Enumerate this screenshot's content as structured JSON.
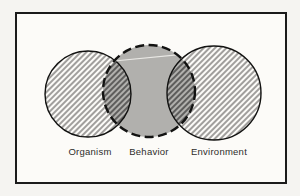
{
  "diagram": {
    "kind": "venn-diagram",
    "labels": {
      "organism": "Organism",
      "behavior": "Behavior",
      "environment": "Environment"
    },
    "colors": {
      "page_background": "#f5f4f1",
      "panel_background": "#fcfbf8",
      "frame_border": "#1b1b1b",
      "behavior_fill": "#b1b0ad",
      "hatch_line": "#4c4b49",
      "hatch_line_dark": "#191918",
      "circle_outline": "#121211",
      "artifact_line": "#f3f2ef"
    }
  }
}
